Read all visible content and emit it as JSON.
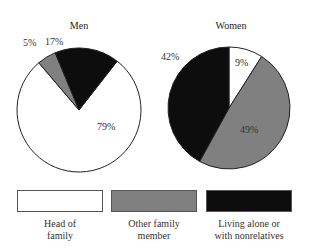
{
  "chart_data": [
    {
      "type": "pie",
      "title": "Men",
      "categories": [
        "Head of family",
        "Other family member",
        "Living alone or with nonrelatives"
      ],
      "values": [
        79,
        5,
        17
      ],
      "labels": [
        "79%",
        "5%",
        "17%"
      ],
      "colors": [
        "#ffffff",
        "#808080",
        "#0d0d0d"
      ]
    },
    {
      "type": "pie",
      "title": "Women",
      "categories": [
        "Head of family",
        "Other family member",
        "Living alone or with nonrelatives"
      ],
      "values": [
        9,
        49,
        42
      ],
      "labels": [
        "9%",
        "49%",
        "42%"
      ],
      "colors": [
        "#ffffff",
        "#808080",
        "#0d0d0d"
      ]
    }
  ],
  "legend": {
    "position": "bottom",
    "items": [
      {
        "line1": "Head of",
        "line2": "family",
        "color": "#ffffff"
      },
      {
        "line1": "Other family",
        "line2": "member",
        "color": "#808080"
      },
      {
        "line1": "Living alone or",
        "line2": "with nonrelatives",
        "color": "#0d0d0d"
      }
    ]
  }
}
